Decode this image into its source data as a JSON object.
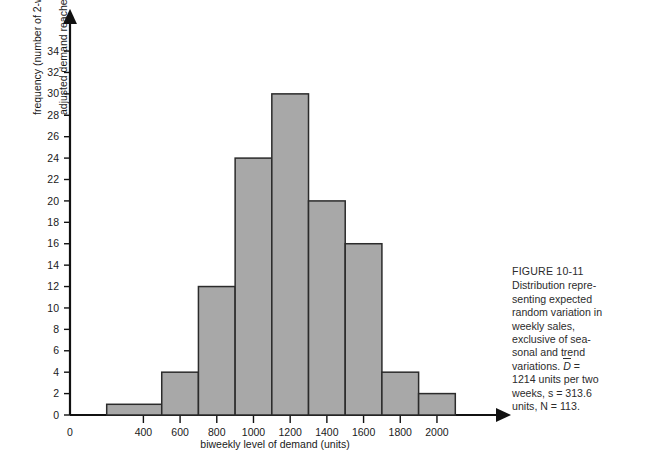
{
  "figure": {
    "caption_title": "FIGURE 10-11",
    "caption_lines": [
      "Distribution repre-",
      "senting expected",
      "random variation in",
      "weekly sales,",
      "exclusive of sea-",
      "sonal and trend",
      "variations. D =",
      "1214 units per two",
      "weeks, s = 313.6",
      "units, N = 113."
    ]
  },
  "axes": {
    "xlabel": "biweekly level of demand (units)",
    "ylabel_line1": "frequency (number of 2-week periods",
    "ylabel_line2": "adjusted demand reached a given level)",
    "y_ticks": [
      0,
      2,
      4,
      6,
      8,
      10,
      12,
      14,
      16,
      18,
      20,
      22,
      24,
      26,
      28,
      30,
      32,
      34
    ],
    "x_ticks": [
      0,
      400,
      600,
      800,
      1000,
      1200,
      1400,
      1600,
      1800,
      2000
    ],
    "xlim": [
      0,
      2300
    ],
    "ylim": [
      0,
      35.5
    ]
  },
  "colors": {
    "bar_fill": "#a8a8a8",
    "bar_stroke": "#2b2b2b",
    "axis": "#111111",
    "background": "#ffffff",
    "caption_text": "#2c2c2c"
  },
  "chart_data": {
    "type": "bar",
    "title": "",
    "xlabel": "biweekly level of demand (units)",
    "ylabel": "frequency (number of 2-week periods adjusted demand reached a given level)",
    "xlim": [
      0,
      2300
    ],
    "ylim": [
      0,
      35.5
    ],
    "grid": false,
    "legend": "none",
    "bin_edges": [
      200,
      500,
      700,
      900,
      1100,
      1300,
      1500,
      1700,
      1900,
      2100
    ],
    "categories": [
      "200-500",
      "500-700",
      "700-900",
      "900-1100",
      "1100-1300",
      "1300-1500",
      "1500-1700",
      "1700-1900",
      "1900-2100"
    ],
    "values": [
      1,
      4,
      12,
      24,
      30,
      20,
      16,
      4,
      2
    ],
    "annotations": {
      "mean_demand": "1214 units per two weeks",
      "std_dev": "313.6 units",
      "sample_size": "113"
    }
  }
}
